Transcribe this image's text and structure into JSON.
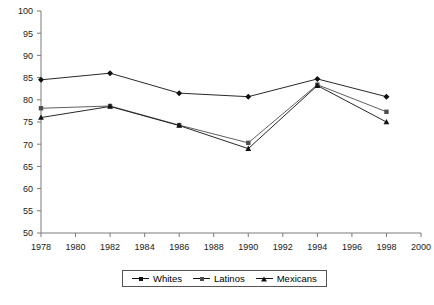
{
  "chart_data": {
    "type": "line",
    "title": "",
    "xlabel": "",
    "ylabel": "",
    "ylim": [
      50,
      100
    ],
    "yticks": [
      50,
      55,
      60,
      65,
      70,
      75,
      80,
      85,
      90,
      95,
      100
    ],
    "xticks": [
      1978,
      1980,
      1982,
      1984,
      1986,
      1988,
      1990,
      1992,
      1994,
      1996,
      1998,
      2000
    ],
    "x": [
      1978,
      1982,
      1986,
      1990,
      1994,
      1998
    ],
    "grid": false,
    "legend_position": "bottom",
    "series": [
      {
        "name": "Whites",
        "marker": "diamond",
        "color": "#111111",
        "values": [
          84.5,
          86.0,
          81.5,
          80.7,
          84.7,
          80.7
        ]
      },
      {
        "name": "Latinos",
        "marker": "square",
        "color": "#4d4d4d",
        "values": [
          78.1,
          78.6,
          74.3,
          70.3,
          83.4,
          77.3
        ]
      },
      {
        "name": "Mexicans",
        "marker": "triangle",
        "color": "#111111",
        "values": [
          76.0,
          78.5,
          74.2,
          69.0,
          83.2,
          75.0
        ]
      }
    ]
  },
  "legend": {
    "entries": [
      {
        "label": "Whites"
      },
      {
        "label": "Latinos"
      },
      {
        "label": "Mexicans"
      }
    ]
  }
}
